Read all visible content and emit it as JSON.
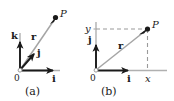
{
  "figure": {
    "background_color": "#ffffff",
    "axis_color": "#a8a8a8",
    "vector_color": "#9a9a9a",
    "ink_color": "#1a1a1a",
    "dash_color": "#9a9a9a",
    "width": 174,
    "height": 101
  },
  "panel_a": {
    "caption": "(a)",
    "origin_label": "0",
    "point_label": "P",
    "vector_r_label": "r",
    "basis_k_label": "k",
    "basis_j_label": "j",
    "basis_i_label": "i",
    "origin": {
      "x": 20,
      "y": 70
    },
    "point_P": {
      "x": 55,
      "y": 16
    },
    "k_tip": {
      "x": 20,
      "y": 35
    },
    "j_tip": {
      "x": 36,
      "y": 50
    },
    "i_tip": {
      "x": 56,
      "y": 70
    }
  },
  "panel_b": {
    "caption": "(b)",
    "origin_label": "0",
    "point_label": "P",
    "vector_r_label": "r",
    "basis_j_label": "j",
    "basis_i_label": "i",
    "axis_x_label": "x",
    "axis_y_label": "y",
    "origin": {
      "x": 96,
      "y": 70
    },
    "point_P": {
      "x": 148,
      "y": 28
    },
    "j_tip": {
      "x": 96,
      "y": 38
    },
    "i_tip": {
      "x": 131,
      "y": 70
    }
  }
}
